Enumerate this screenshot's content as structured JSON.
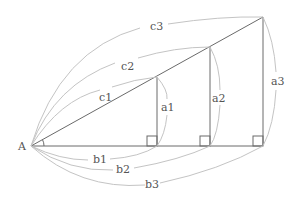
{
  "diagram": {
    "vertex_label": "A",
    "triangles": [
      {
        "hypotenuse": "c1",
        "opposite": "a1",
        "adjacent": "b1"
      },
      {
        "hypotenuse": "c2",
        "opposite": "a2",
        "adjacent": "b2"
      },
      {
        "hypotenuse": "c3",
        "opposite": "a3",
        "adjacent": "b3"
      }
    ],
    "colors": {
      "line": "#6a6a6a",
      "brace": "#c4c4c4",
      "text": "#555555"
    }
  }
}
